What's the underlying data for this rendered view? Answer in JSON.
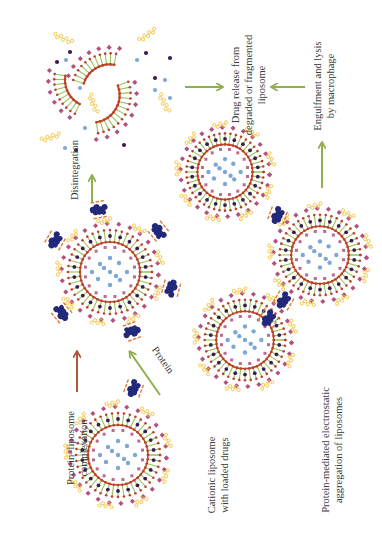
{
  "figure": {
    "orientation": "rotated-90-ccw",
    "colors": {
      "background": "#ffffff",
      "green_arrow": "#8fb04f",
      "red_arrow": "#b0563a",
      "outer_lipid_head": "#b2507e",
      "inner_lipid_head": "#b8402e",
      "lipid_tail": "#9cc35a",
      "inner_ring": "#c04a1e",
      "peg_chain": "#f2c23c",
      "drug_dot": "#7ea7d8",
      "dark_dot": "#3a1d4f",
      "protein": "#22287a",
      "protein_charge": "#e07a3a",
      "text": "#3a3a3a"
    },
    "labels": {
      "cationic_liposome": [
        "Cationic liposome",
        "with loaded drugs"
      ],
      "protein_liposome_complexation": [
        "Protein–liposome",
        "complexation"
      ],
      "protein": "Protein",
      "disintegration": "Disintegration",
      "drug_release": [
        "Drug release from",
        "degraded or fragmented",
        "liposome"
      ],
      "engulfment": [
        "Engulfment and lysis",
        "by  macrophage"
      ],
      "aggregation": [
        "Protein-mediated electrostatic",
        "aggregation of liposomes"
      ]
    },
    "nodes": [
      {
        "id": "liposome-cationic",
        "cx": 118,
        "cy": 455,
        "r": 50,
        "proteins": 0
      },
      {
        "id": "liposome-protein-complex",
        "cx": 110,
        "cy": 272,
        "r": 50,
        "proteins": 6
      },
      {
        "id": "liposome-aggregate-1",
        "cx": 245,
        "cy": 340,
        "r": 48,
        "proteins": 0
      },
      {
        "id": "liposome-aggregate-2",
        "cx": 320,
        "cy": 255,
        "r": 48,
        "proteins": 0
      },
      {
        "id": "liposome-aggregate-3",
        "cx": 225,
        "cy": 172,
        "r": 46,
        "proteins": 0
      },
      {
        "id": "fragmented-liposome",
        "cx": 85,
        "cy": 88,
        "r": 45
      }
    ],
    "arrows": [
      {
        "id": "arrow-complexation",
        "color": "red",
        "x1": 77,
        "y1": 392,
        "x2": 77,
        "y2": 352
      },
      {
        "id": "arrow-protein",
        "color": "green",
        "x1": 160,
        "y1": 395,
        "x2": 130,
        "y2": 352
      },
      {
        "id": "arrow-disintegration",
        "color": "green",
        "x1": 92,
        "y1": 202,
        "x2": 92,
        "y2": 176
      },
      {
        "id": "arrow-to-release-left",
        "color": "green",
        "x1": 185,
        "y1": 87,
        "x2": 222,
        "y2": 87
      },
      {
        "id": "arrow-to-release-right",
        "color": "green",
        "x1": 305,
        "y1": 87,
        "x2": 272,
        "y2": 87
      },
      {
        "id": "arrow-engulfment",
        "color": "green",
        "x1": 322,
        "y1": 188,
        "x2": 322,
        "y2": 143
      }
    ]
  }
}
